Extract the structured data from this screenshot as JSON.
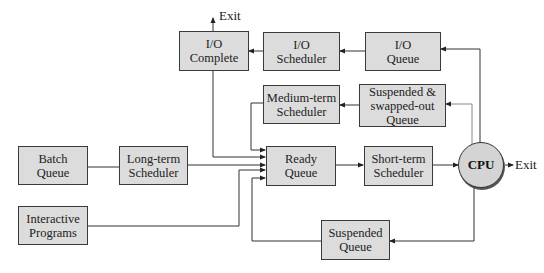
{
  "diagram": {
    "nodes": {
      "io_complete": {
        "line1": "I/O",
        "line2": "Complete"
      },
      "io_scheduler": {
        "line1": "I/O",
        "line2": "Scheduler"
      },
      "io_queue": {
        "line1": "I/O",
        "line2": "Queue"
      },
      "medium_term_scheduler": {
        "line1": "Medium-term",
        "line2": "Scheduler"
      },
      "suspended_swapped_queue": {
        "line1": "Suspended &",
        "line2": "swapped-out",
        "line3": "Queue"
      },
      "batch_queue": {
        "line1": "Batch",
        "line2": "Queue"
      },
      "long_term_scheduler": {
        "line1": "Long-term",
        "line2": "Scheduler"
      },
      "ready_queue": {
        "line1": "Ready",
        "line2": "Queue"
      },
      "short_term_scheduler": {
        "line1": "Short-term",
        "line2": "Scheduler"
      },
      "cpu": {
        "label": "CPU"
      },
      "interactive_programs": {
        "line1": "Interactive",
        "line2": "Programs"
      },
      "suspended_queue": {
        "line1": "Suspended",
        "line2": "Queue"
      }
    },
    "exit_labels": {
      "top": "Exit",
      "cpu": "Exit"
    },
    "edges": [
      {
        "from": "Batch Queue",
        "to": "Long-term Scheduler"
      },
      {
        "from": "Long-term Scheduler",
        "to": "Ready Queue"
      },
      {
        "from": "Interactive Programs",
        "to": "Ready Queue"
      },
      {
        "from": "Ready Queue",
        "to": "Short-term Scheduler"
      },
      {
        "from": "Short-term Scheduler",
        "to": "CPU"
      },
      {
        "from": "CPU",
        "to": "Exit"
      },
      {
        "from": "CPU",
        "to": "I/O Queue"
      },
      {
        "from": "CPU",
        "to": "Suspended & swapped-out Queue"
      },
      {
        "from": "CPU",
        "to": "Suspended Queue"
      },
      {
        "from": "I/O Queue",
        "to": "I/O Scheduler"
      },
      {
        "from": "I/O Scheduler",
        "to": "I/O Complete"
      },
      {
        "from": "I/O Complete",
        "to": "Exit"
      },
      {
        "from": "I/O Complete",
        "to": "Ready Queue"
      },
      {
        "from": "Suspended & swapped-out Queue",
        "to": "Medium-term Scheduler"
      },
      {
        "from": "Medium-term Scheduler",
        "to": "Ready Queue"
      },
      {
        "from": "Suspended Queue",
        "to": "Ready Queue"
      }
    ],
    "colors": {
      "box_fill": "#dcdcdc",
      "box_border": "#3a3a3a",
      "line": "#333333",
      "background": "#ffffff"
    }
  }
}
